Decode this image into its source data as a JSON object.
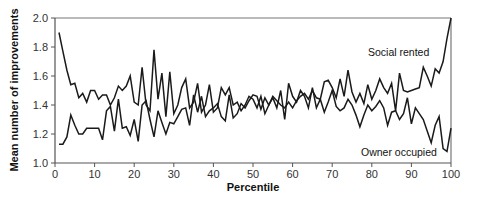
{
  "chart_data": {
    "type": "line",
    "title": "",
    "xlabel": "Percentile",
    "ylabel": "Mean number of improvements",
    "xlim": [
      0,
      100
    ],
    "ylim": [
      1.0,
      2.0
    ],
    "xticks": [
      0,
      10,
      20,
      30,
      40,
      50,
      60,
      70,
      80,
      90,
      100
    ],
    "yticks": [
      1.0,
      1.2,
      1.4,
      1.6,
      1.8,
      2.0
    ],
    "xtick_labels": [
      "0",
      "10",
      "20",
      "30",
      "40",
      "50",
      "60",
      "70",
      "80",
      "90",
      "100"
    ],
    "ytick_labels": [
      "1.0",
      "1.2",
      "1.4",
      "1.6",
      "1.8",
      "2.0"
    ],
    "grid": false,
    "legend": "inline labels",
    "x": [
      1,
      2,
      3,
      4,
      5,
      6,
      7,
      8,
      9,
      10,
      11,
      12,
      13,
      14,
      15,
      16,
      17,
      18,
      19,
      20,
      21,
      22,
      23,
      24,
      25,
      26,
      27,
      28,
      29,
      30,
      31,
      32,
      33,
      34,
      35,
      36,
      37,
      38,
      39,
      40,
      41,
      42,
      43,
      44,
      45,
      46,
      47,
      48,
      49,
      50,
      51,
      52,
      53,
      54,
      55,
      56,
      57,
      58,
      59,
      60,
      61,
      62,
      63,
      64,
      65,
      66,
      67,
      68,
      69,
      70,
      71,
      72,
      73,
      74,
      75,
      76,
      77,
      78,
      79,
      80,
      81,
      82,
      83,
      84,
      85,
      86,
      87,
      88,
      89,
      90,
      91,
      92,
      93,
      94,
      95,
      96,
      97,
      98,
      99,
      100
    ],
    "series": [
      {
        "name": "Social rented",
        "values": [
          1.13,
          1.13,
          1.18,
          1.33,
          1.26,
          1.2,
          1.2,
          1.24,
          1.24,
          1.24,
          1.24,
          1.16,
          1.36,
          1.39,
          1.22,
          1.44,
          1.24,
          1.25,
          1.19,
          1.3,
          1.15,
          1.4,
          1.43,
          1.3,
          1.18,
          1.36,
          1.28,
          1.2,
          1.28,
          1.27,
          1.32,
          1.37,
          1.38,
          1.26,
          1.47,
          1.35,
          1.46,
          1.32,
          1.36,
          1.38,
          1.41,
          1.32,
          1.29,
          1.47,
          1.31,
          1.34,
          1.41,
          1.38,
          1.43,
          1.47,
          1.46,
          1.37,
          1.45,
          1.4,
          1.46,
          1.43,
          1.4,
          1.38,
          1.42,
          1.38,
          1.43,
          1.46,
          1.48,
          1.44,
          1.5,
          1.45,
          1.44,
          1.56,
          1.57,
          1.52,
          1.45,
          1.58,
          1.46,
          1.64,
          1.49,
          1.42,
          1.48,
          1.41,
          1.54,
          1.44,
          1.5,
          1.58,
          1.52,
          1.48,
          1.55,
          1.36,
          1.62,
          1.5,
          1.49,
          1.5,
          1.51,
          1.52,
          1.66,
          1.6,
          1.53,
          1.65,
          1.62,
          1.7,
          1.86,
          2.0
        ]
      },
      {
        "name": "Owner occupied",
        "values": [
          1.9,
          1.77,
          1.64,
          1.54,
          1.55,
          1.45,
          1.48,
          1.42,
          1.5,
          1.5,
          1.44,
          1.47,
          1.47,
          1.4,
          1.45,
          1.53,
          1.5,
          1.53,
          1.6,
          1.42,
          1.4,
          1.66,
          1.4,
          1.36,
          1.78,
          1.44,
          1.62,
          1.32,
          1.63,
          1.34,
          1.4,
          1.52,
          1.58,
          1.38,
          1.42,
          1.55,
          1.35,
          1.4,
          1.54,
          1.35,
          1.38,
          1.52,
          1.47,
          1.52,
          1.4,
          1.42,
          1.36,
          1.4,
          1.46,
          1.44,
          1.38,
          1.46,
          1.34,
          1.4,
          1.45,
          1.38,
          1.5,
          1.3,
          1.55,
          1.46,
          1.42,
          1.5,
          1.46,
          1.38,
          1.52,
          1.38,
          1.44,
          1.35,
          1.42,
          1.5,
          1.39,
          1.36,
          1.38,
          1.44,
          1.4,
          1.33,
          1.25,
          1.33,
          1.4,
          1.36,
          1.39,
          1.43,
          1.38,
          1.26,
          1.35,
          1.36,
          1.3,
          1.34,
          1.45,
          1.27,
          1.38,
          1.34,
          1.3,
          1.22,
          1.14,
          1.26,
          1.32,
          1.1,
          1.08,
          1.24
        ]
      }
    ],
    "annotations": [
      {
        "text": "Social rented",
        "x": 86,
        "y": 1.79
      },
      {
        "text": "Owner occupied",
        "x": 84,
        "y": 1.06
      }
    ]
  },
  "colors": {
    "line": "#1a1a1a",
    "axis": "#555555",
    "background": "#ffffff"
  }
}
